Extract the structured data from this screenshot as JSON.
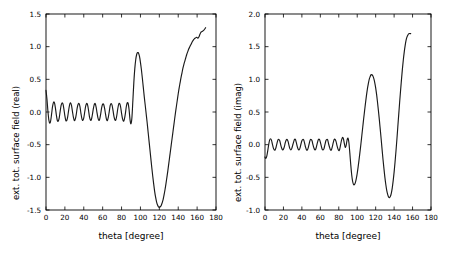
{
  "figure": {
    "width": 451,
    "height": 257,
    "background": "#ffffff",
    "line_color": "#1a1a1a",
    "axis_color": "#000000"
  },
  "chart_data": [
    {
      "type": "line",
      "panel_id": "real",
      "title": "",
      "xlabel": "theta [degree]",
      "ylabel": "ext. tot. surface field (real)",
      "xlim": [
        0,
        180
      ],
      "ylim": [
        -1.5,
        1.5
      ],
      "xticks": [
        0,
        20,
        40,
        60,
        80,
        100,
        120,
        140,
        160,
        180
      ],
      "xticklabels": [
        "0",
        "20",
        "40",
        "60",
        "80",
        "100",
        "120",
        "140",
        "160",
        "180"
      ],
      "yticks": [
        -1.5,
        -1.0,
        -0.5,
        0.0,
        0.5,
        1.0,
        1.5
      ],
      "yticklabels": [
        "-1.5",
        "-1.0",
        "-0.5",
        "0.0",
        "0.5",
        "1.0",
        "1.5"
      ],
      "grid": false,
      "legend": null,
      "series": [
        {
          "name": "ext. tot. surface field (real)",
          "x": [
            0,
            1,
            2,
            3,
            4,
            5,
            6,
            7,
            8,
            9,
            10,
            11,
            12,
            13,
            14,
            15,
            16,
            17,
            18,
            19,
            20,
            21,
            22,
            23,
            24,
            25,
            26,
            27,
            28,
            29,
            30,
            31,
            32,
            33,
            34,
            35,
            36,
            37,
            38,
            39,
            40,
            41,
            42,
            43,
            44,
            45,
            46,
            47,
            48,
            49,
            50,
            51,
            52,
            53,
            54,
            55,
            56,
            57,
            58,
            59,
            60,
            61,
            62,
            63,
            64,
            65,
            66,
            67,
            68,
            69,
            70,
            71,
            72,
            73,
            74,
            75,
            76,
            77,
            78,
            79,
            80,
            81,
            82,
            83,
            84,
            85,
            86,
            87,
            88,
            89,
            90,
            91,
            92,
            93,
            94,
            95,
            96,
            97,
            98,
            99,
            100,
            101,
            102,
            103,
            104,
            105,
            106,
            107,
            108,
            109,
            110,
            111,
            112,
            113,
            114,
            115,
            116,
            117,
            118,
            119,
            120,
            121,
            122,
            123,
            124,
            125,
            126,
            127,
            128,
            129,
            130,
            131,
            132,
            133,
            134,
            135,
            136,
            137,
            138,
            139,
            140,
            141,
            142,
            143,
            144,
            145,
            146,
            147,
            148,
            149,
            150,
            151,
            152,
            153,
            154,
            155,
            156,
            157,
            158,
            159,
            160,
            161,
            162,
            163,
            164,
            165,
            166,
            167,
            168,
            169,
            170,
            171,
            172,
            173,
            174,
            175,
            176,
            177,
            178,
            179,
            180
          ],
          "y": [
            0.33,
            0.2,
            0.02,
            -0.12,
            -0.17,
            -0.13,
            -0.02,
            0.09,
            0.15,
            0.14,
            0.06,
            -0.05,
            -0.13,
            -0.14,
            -0.09,
            0.01,
            0.1,
            0.14,
            0.12,
            0.04,
            -0.06,
            -0.13,
            -0.13,
            -0.07,
            0.03,
            0.11,
            0.14,
            0.1,
            0.01,
            -0.08,
            -0.13,
            -0.11,
            -0.04,
            0.06,
            0.12,
            0.13,
            0.08,
            -0.02,
            -0.1,
            -0.13,
            -0.09,
            0.0,
            0.09,
            0.13,
            0.11,
            0.03,
            -0.07,
            -0.12,
            -0.12,
            -0.05,
            0.04,
            0.11,
            0.13,
            0.08,
            -0.01,
            -0.09,
            -0.13,
            -0.1,
            -0.02,
            0.07,
            0.12,
            0.12,
            0.06,
            -0.03,
            -0.11,
            -0.13,
            -0.08,
            0.01,
            0.1,
            0.13,
            0.1,
            0.02,
            -0.07,
            -0.12,
            -0.12,
            -0.05,
            0.05,
            0.12,
            0.13,
            0.08,
            -0.02,
            -0.1,
            -0.14,
            -0.11,
            -0.03,
            0.08,
            0.14,
            0.13,
            0.03,
            -0.12,
            -0.18,
            -0.08,
            0.18,
            0.45,
            0.66,
            0.8,
            0.88,
            0.91,
            0.9,
            0.85,
            0.76,
            0.65,
            0.52,
            0.38,
            0.24,
            0.11,
            -0.02,
            -0.15,
            -0.29,
            -0.43,
            -0.57,
            -0.71,
            -0.85,
            -0.98,
            -1.1,
            -1.21,
            -1.3,
            -1.37,
            -1.42,
            -1.45,
            -1.46,
            -1.45,
            -1.43,
            -1.39,
            -1.34,
            -1.27,
            -1.19,
            -1.1,
            -1.0,
            -0.9,
            -0.79,
            -0.68,
            -0.57,
            -0.46,
            -0.35,
            -0.24,
            -0.13,
            -0.02,
            0.08,
            0.18,
            0.28,
            0.37,
            0.45,
            0.53,
            0.6,
            0.67,
            0.73,
            0.78,
            0.83,
            0.88,
            0.92,
            0.96,
            0.99,
            1.02,
            1.05,
            1.08,
            1.1,
            1.12,
            1.13,
            1.14,
            1.14,
            1.13,
            1.15,
            1.19,
            1.22,
            1.23,
            1.24,
            1.25,
            1.27,
            1.29,
            1.31
          ]
        }
      ]
    },
    {
      "type": "line",
      "panel_id": "imag",
      "title": "",
      "xlabel": "theta [degree]",
      "ylabel": "ext. tot. surface field (imag)",
      "xlim": [
        0,
        180
      ],
      "ylim": [
        -1.0,
        2.0
      ],
      "xticks": [
        0,
        20,
        40,
        60,
        80,
        100,
        120,
        140,
        160,
        180
      ],
      "xticklabels": [
        "0",
        "20",
        "40",
        "60",
        "80",
        "100",
        "120",
        "140",
        "160",
        "180"
      ],
      "yticks": [
        -1.0,
        -0.5,
        0.0,
        0.5,
        1.0,
        1.5,
        2.0
      ],
      "yticklabels": [
        "-1.0",
        "-0.5",
        "0.0",
        "0.5",
        "1.0",
        "1.5",
        "2.0"
      ],
      "grid": false,
      "legend": null,
      "series": [
        {
          "name": "ext. tot. surface field (imag)",
          "x": [
            0,
            1,
            2,
            3,
            4,
            5,
            6,
            7,
            8,
            9,
            10,
            11,
            12,
            13,
            14,
            15,
            16,
            17,
            18,
            19,
            20,
            21,
            22,
            23,
            24,
            25,
            26,
            27,
            28,
            29,
            30,
            31,
            32,
            33,
            34,
            35,
            36,
            37,
            38,
            39,
            40,
            41,
            42,
            43,
            44,
            45,
            46,
            47,
            48,
            49,
            50,
            51,
            52,
            53,
            54,
            55,
            56,
            57,
            58,
            59,
            60,
            61,
            62,
            63,
            64,
            65,
            66,
            67,
            68,
            69,
            70,
            71,
            72,
            73,
            74,
            75,
            76,
            77,
            78,
            79,
            80,
            81,
            82,
            83,
            84,
            85,
            86,
            87,
            88,
            89,
            90,
            91,
            92,
            93,
            94,
            95,
            96,
            97,
            98,
            99,
            100,
            101,
            102,
            103,
            104,
            105,
            106,
            107,
            108,
            109,
            110,
            111,
            112,
            113,
            114,
            115,
            116,
            117,
            118,
            119,
            120,
            121,
            122,
            123,
            124,
            125,
            126,
            127,
            128,
            129,
            130,
            131,
            132,
            133,
            134,
            135,
            136,
            137,
            138,
            139,
            140,
            141,
            142,
            143,
            144,
            145,
            146,
            147,
            148,
            149,
            150,
            151,
            152,
            153,
            154,
            155,
            156,
            157,
            158,
            159,
            160,
            161,
            162,
            163,
            164,
            165,
            166,
            167,
            168,
            169,
            170,
            171,
            172,
            173,
            174,
            175,
            176,
            177,
            178,
            179,
            180
          ],
          "y": [
            -0.19,
            -0.21,
            -0.17,
            -0.09,
            0.0,
            0.07,
            0.09,
            0.07,
            0.01,
            -0.05,
            -0.08,
            -0.08,
            -0.04,
            0.02,
            0.07,
            0.08,
            0.06,
            0.0,
            -0.05,
            -0.08,
            -0.07,
            -0.03,
            0.03,
            0.07,
            0.08,
            0.05,
            -0.01,
            -0.06,
            -0.08,
            -0.06,
            -0.01,
            0.04,
            0.08,
            0.08,
            0.03,
            -0.03,
            -0.07,
            -0.08,
            -0.05,
            0.01,
            0.06,
            0.08,
            0.07,
            0.02,
            -0.04,
            -0.08,
            -0.08,
            -0.04,
            0.02,
            0.07,
            0.08,
            0.06,
            0.0,
            -0.05,
            -0.08,
            -0.07,
            -0.02,
            0.04,
            0.08,
            0.08,
            0.04,
            -0.02,
            -0.07,
            -0.08,
            -0.06,
            0.0,
            0.06,
            0.08,
            0.07,
            0.01,
            -0.04,
            -0.08,
            -0.08,
            -0.03,
            0.03,
            0.08,
            0.08,
            0.05,
            -0.01,
            -0.06,
            -0.09,
            -0.07,
            0.0,
            0.07,
            0.11,
            0.09,
            0.02,
            -0.04,
            -0.01,
            0.07,
            0.1,
            0.03,
            -0.13,
            -0.31,
            -0.46,
            -0.56,
            -0.61,
            -0.61,
            -0.58,
            -0.52,
            -0.44,
            -0.34,
            -0.23,
            -0.11,
            0.01,
            0.14,
            0.27,
            0.4,
            0.52,
            0.64,
            0.75,
            0.85,
            0.93,
            1.0,
            1.04,
            1.07,
            1.07,
            1.05,
            1.01,
            0.95,
            0.87,
            0.77,
            0.65,
            0.52,
            0.38,
            0.23,
            0.08,
            -0.08,
            -0.23,
            -0.37,
            -0.5,
            -0.61,
            -0.7,
            -0.76,
            -0.8,
            -0.81,
            -0.79,
            -0.74,
            -0.66,
            -0.55,
            -0.42,
            -0.27,
            -0.1,
            0.08,
            0.27,
            0.46,
            0.65,
            0.83,
            1.0,
            1.16,
            1.3,
            1.42,
            1.52,
            1.6,
            1.65,
            1.68,
            1.7,
            1.7,
            1.7,
            1.7
          ]
        }
      ]
    }
  ]
}
